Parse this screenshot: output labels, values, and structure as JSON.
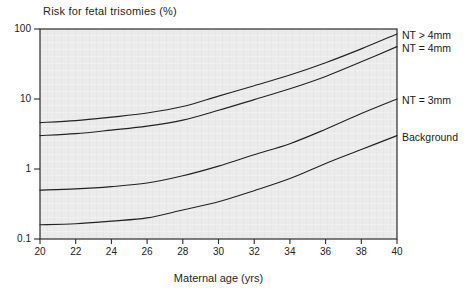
{
  "title": "Risk for fetal trisomies (%)",
  "chart_data": {
    "type": "line",
    "title": "Risk for fetal trisomies (%)",
    "xlabel": "Maternal age (yrs)",
    "ylabel": "Risk for fetal trisomies (%)",
    "x": [
      20,
      22,
      24,
      26,
      28,
      30,
      32,
      34,
      36,
      38,
      40
    ],
    "x_tick_labels": [
      "20",
      "22",
      "24",
      "26",
      "28",
      "30",
      "32",
      "34",
      "36",
      "38",
      "40"
    ],
    "y_tick_labels": [
      "100",
      "10",
      "1",
      "0.1"
    ],
    "yscale": "log",
    "ylim": [
      0.1,
      100
    ],
    "xlim": [
      20,
      40
    ],
    "grid": false,
    "legend_position": "right-outside",
    "series": [
      {
        "name": "NT > 4mm",
        "values": [
          4.6,
          4.9,
          5.5,
          6.3,
          7.8,
          11,
          15.5,
          22,
          33,
          52,
          85
        ]
      },
      {
        "name": "NT = 4mm",
        "values": [
          3.0,
          3.2,
          3.6,
          4.1,
          5.0,
          6.9,
          9.8,
          14,
          21,
          34,
          56
        ]
      },
      {
        "name": "NT = 3mm",
        "values": [
          0.5,
          0.52,
          0.56,
          0.63,
          0.8,
          1.1,
          1.6,
          2.3,
          3.7,
          6.2,
          10
        ]
      },
      {
        "name": "Background",
        "values": [
          0.16,
          0.165,
          0.18,
          0.2,
          0.26,
          0.34,
          0.49,
          0.73,
          1.2,
          1.9,
          3.0
        ]
      }
    ]
  },
  "colors": {
    "curve": "#222222",
    "axis": "#2b2b2b",
    "plot_background": "#ebebeb",
    "page_background": "#ffffff",
    "text": "#1a1a1a"
  }
}
